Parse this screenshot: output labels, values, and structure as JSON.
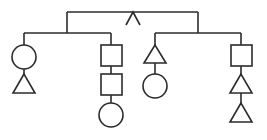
{
  "diagram": {
    "type": "tree",
    "colors": {
      "stroke": "#2b2b2b",
      "background": "#ffffff"
    },
    "root": {
      "symbol": "caret",
      "label": "∧"
    },
    "branches": [
      {
        "name": "left",
        "columns": [
          {
            "x": 24,
            "sequence": [
              "circle",
              "triangle"
            ]
          },
          {
            "x": 111,
            "sequence": [
              "square",
              "square",
              "circle"
            ]
          }
        ]
      },
      {
        "name": "right",
        "columns": [
          {
            "x": 155,
            "sequence": [
              "triangle",
              "circle"
            ]
          },
          {
            "x": 241,
            "sequence": [
              "square",
              "triangle",
              "triangle"
            ]
          }
        ]
      }
    ]
  }
}
